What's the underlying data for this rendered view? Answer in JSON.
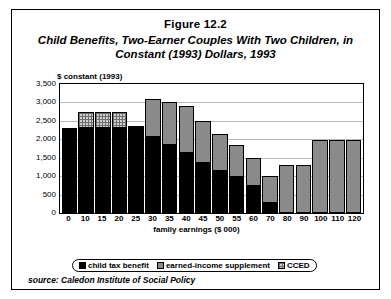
{
  "figure": {
    "number": "Figure 12.2",
    "caption": "Child Benefits, Two-Earner Couples With Two Children, in Constant (1993) Dollars, 1993",
    "source": "source: Caledon Institute of Social Policy"
  },
  "chart_data": {
    "type": "bar",
    "stacked": true,
    "title": "Child Benefits, Two-Earner Couples With Two Children, in Constant (1993) Dollars, 1993",
    "xlabel": "family earnings ($ 000)",
    "ylabel": "$ constant (1993)",
    "ylim": [
      0,
      3500
    ],
    "ytick_step": 500,
    "ytick_labels": [
      "0",
      "500",
      "1,000",
      "1,500",
      "2,000",
      "2,500",
      "3,000",
      "3,500"
    ],
    "grid": true,
    "legend_position": "bottom",
    "categories": [
      "0",
      "10",
      "15",
      "20",
      "25",
      "30",
      "35",
      "40",
      "45",
      "50",
      "55",
      "60",
      "70",
      "80",
      "90",
      "100",
      "110",
      "120"
    ],
    "series": [
      {
        "name": "child tax benefit",
        "color": "#000000",
        "values": [
          2300,
          2300,
          2300,
          2300,
          2300,
          2050,
          1850,
          1620,
          1350,
          1150,
          980,
          720,
          280,
          0,
          0,
          0,
          0,
          0
        ]
      },
      {
        "name": "earned-income supplement",
        "color": "#8a8a8a",
        "values": [
          0,
          0,
          0,
          0,
          0,
          1050,
          1150,
          1280,
          1150,
          1000,
          870,
          770,
          720,
          1300,
          1300,
          1980,
          1980,
          1980
        ]
      },
      {
        "name": "CCED",
        "color": "#cfcfcf",
        "values": [
          0,
          450,
          450,
          450,
          50,
          0,
          0,
          0,
          0,
          0,
          0,
          0,
          0,
          0,
          0,
          0,
          0,
          0
        ]
      }
    ],
    "totals": [
      2300,
      2750,
      2750,
      2750,
      2350,
      3100,
      3000,
      2900,
      2500,
      2150,
      1850,
      1490,
      1000,
      1300,
      1300,
      1980,
      1980,
      1980
    ]
  },
  "legend": {
    "items": [
      {
        "label": "child tax benefit",
        "swatch": "black-solid-swatch"
      },
      {
        "label": "earned-income supplement",
        "swatch": "gray-dotted-swatch"
      },
      {
        "label": "CCED",
        "swatch": "gray-checkered-swatch"
      }
    ]
  }
}
